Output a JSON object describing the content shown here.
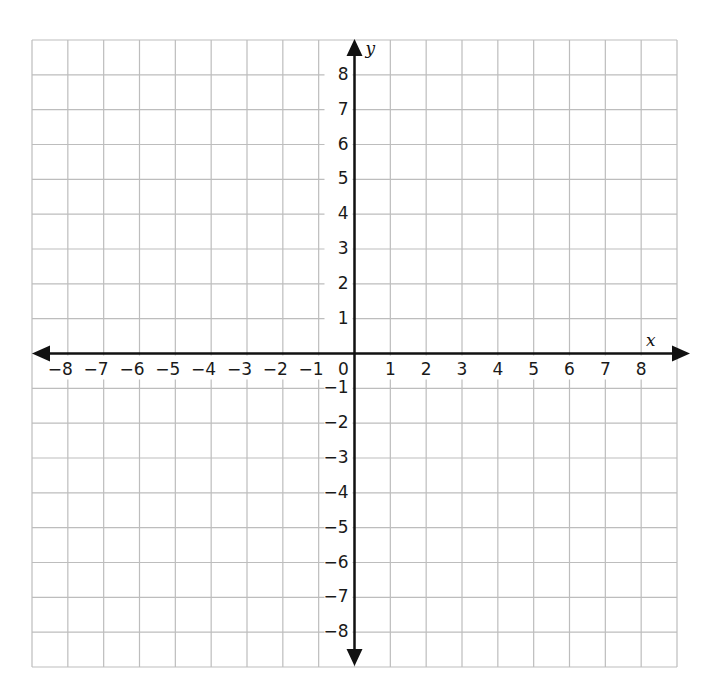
{
  "chart_data": {
    "type": "coordinate-grid",
    "title": "",
    "xlabel": "x",
    "ylabel": "y",
    "xlim": [
      -9,
      9
    ],
    "ylim": [
      -9,
      9
    ],
    "grid": true,
    "x_ticks": [
      -8,
      -7,
      -6,
      -5,
      -4,
      -3,
      -2,
      -1,
      0,
      1,
      2,
      3,
      4,
      5,
      6,
      7,
      8
    ],
    "y_ticks": [
      -8,
      -7,
      -6,
      -5,
      -4,
      -3,
      -2,
      -1,
      1,
      2,
      3,
      4,
      5,
      6,
      7,
      8
    ],
    "x_tick_labels": [
      "−8",
      "−7",
      "−6",
      "−5",
      "−4",
      "−3",
      "−2",
      "−1",
      "0",
      "1",
      "2",
      "3",
      "4",
      "5",
      "6",
      "7",
      "8"
    ],
    "y_tick_labels": [
      "−8",
      "−7",
      "−6",
      "−5",
      "−4",
      "−3",
      "−2",
      "−1",
      "1",
      "2",
      "3",
      "4",
      "5",
      "6",
      "7",
      "8"
    ],
    "series": [],
    "arrows": {
      "x_axis": "both",
      "y_axis": "both"
    }
  },
  "colors": {
    "grid": "#bdbdbd",
    "axis": "#111111",
    "background": "#ffffff"
  },
  "layout": {
    "grid_left": 32,
    "grid_top": 40,
    "grid_right": 677,
    "grid_bottom": 667,
    "columns": 18,
    "rows": 18
  }
}
